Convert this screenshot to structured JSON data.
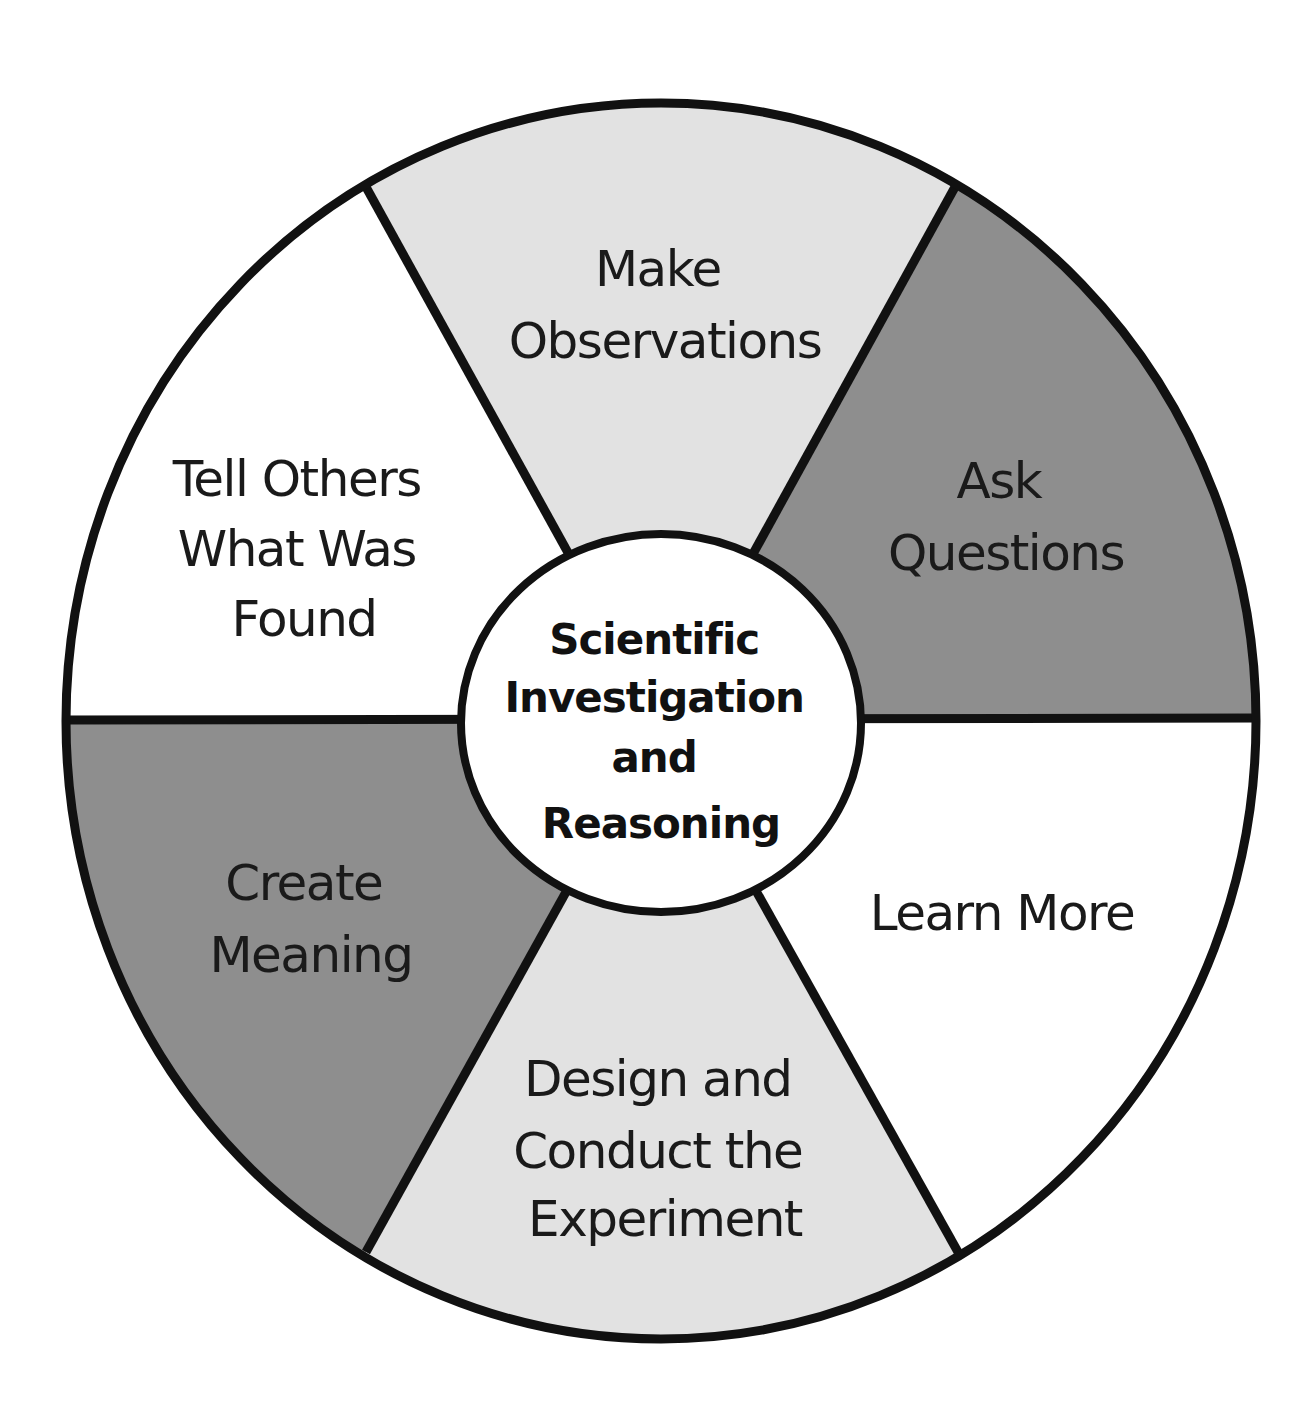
{
  "diagram": {
    "type": "cycle-wheel",
    "center": {
      "lines": [
        "Scientific",
        "Investigation",
        "and",
        "Reasoning"
      ]
    },
    "segments": [
      {
        "id": "make-observations",
        "lines": [
          "Make",
          "Observations"
        ],
        "fill": "#e2e2e2"
      },
      {
        "id": "ask-questions",
        "lines": [
          "Ask",
          "Questions"
        ],
        "fill": "#8e8e8e"
      },
      {
        "id": "learn-more",
        "lines": [
          "Learn More"
        ],
        "fill": "#ffffff"
      },
      {
        "id": "design-and-conduct",
        "lines": [
          "Design and",
          "Conduct the",
          "Experiment"
        ],
        "fill": "#e2e2e2"
      },
      {
        "id": "create-meaning",
        "lines": [
          "Create",
          "Meaning"
        ],
        "fill": "#8e8e8e"
      },
      {
        "id": "tell-others",
        "lines": [
          "Tell Others",
          "What Was",
          "Found"
        ],
        "fill": "#ffffff"
      }
    ],
    "colors": {
      "stroke": "#111111",
      "light_gray": "#e2e2e2",
      "dark_gray": "#8e8e8e",
      "white": "#ffffff"
    }
  }
}
